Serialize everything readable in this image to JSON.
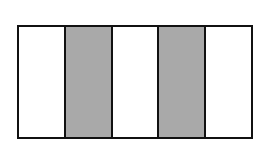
{
  "diagram": {
    "type": "fraction-bar",
    "total_parts": 5,
    "shaded_parts": 2,
    "parts": [
      {
        "index": 1,
        "shaded": false
      },
      {
        "index": 2,
        "shaded": true
      },
      {
        "index": 3,
        "shaded": false
      },
      {
        "index": 4,
        "shaded": true
      },
      {
        "index": 5,
        "shaded": false
      }
    ],
    "colors": {
      "shaded": "#a9a9a9",
      "unshaded": "#ffffff",
      "border": "#111111"
    }
  }
}
